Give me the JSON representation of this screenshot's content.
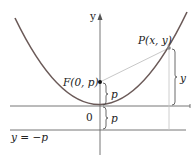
{
  "diagram": {
    "type": "parabola-focus-directrix",
    "axes": {
      "y_label": "y",
      "origin_label": "0"
    },
    "focus": {
      "label": "F(0, p)"
    },
    "point": {
      "label": "P(x, y)"
    },
    "directrix": {
      "label": "y = −p"
    },
    "brackets": {
      "focus_to_vertex": "p",
      "vertex_to_directrix": "p",
      "point_height": "y"
    },
    "colors": {
      "curve": "#6b5a58",
      "axes": "#555555",
      "segment": "#c8c8c8",
      "text": "#222222"
    }
  }
}
